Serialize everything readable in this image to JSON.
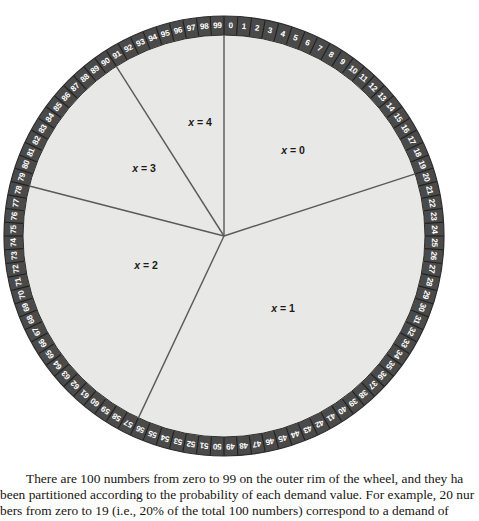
{
  "figure": {
    "name": "roulette-wheel-diagram",
    "colors": {
      "rim_fill": "#4a4a4a",
      "rim_stroke": "#2e2e2e",
      "disc_fill": "#e8e8e6",
      "divider_stroke": "#5a5a5a",
      "tick_stroke": "#20201f",
      "number_text": "#ffffff",
      "label_text": "#1a1a1a",
      "page_background": "#ffffff"
    },
    "geometry": {
      "center_x": 224,
      "center_y": 236,
      "outer_radius": 220,
      "inner_radius": 201,
      "number_radius": 210.5
    },
    "rim_numbers": [
      "0",
      "1",
      "2",
      "3",
      "4",
      "5",
      "6",
      "7",
      "8",
      "9",
      "10",
      "11",
      "12",
      "13",
      "14",
      "15",
      "16",
      "17",
      "18",
      "19",
      "20",
      "21",
      "22",
      "23",
      "24",
      "25",
      "26",
      "27",
      "28",
      "29",
      "30",
      "31",
      "32",
      "33",
      "34",
      "35",
      "36",
      "37",
      "38",
      "39",
      "40",
      "41",
      "42",
      "43",
      "44",
      "45",
      "46",
      "47",
      "48",
      "49",
      "50",
      "51",
      "52",
      "53",
      "54",
      "55",
      "56",
      "57",
      "58",
      "59",
      "60",
      "61",
      "62",
      "63",
      "64",
      "65",
      "66",
      "67",
      "68",
      "69",
      "70",
      "71",
      "72",
      "73",
      "74",
      "75",
      "76",
      "77",
      "78",
      "79",
      "80",
      "81",
      "82",
      "83",
      "84",
      "85",
      "86",
      "87",
      "88",
      "89",
      "90",
      "91",
      "92",
      "93",
      "94",
      "95",
      "96",
      "97",
      "98",
      "99"
    ],
    "sectors": [
      {
        "id": "x0",
        "label_x": "x",
        "label_eq": "= 0",
        "start_number": 0,
        "end_number": 20,
        "label_px": 293,
        "label_py": 150
      },
      {
        "id": "x1",
        "label_x": "x",
        "label_eq": "= 1",
        "start_number": 20,
        "end_number": 57,
        "label_px": 283,
        "label_py": 308
      },
      {
        "id": "x2",
        "label_x": "x",
        "label_eq": "= 2",
        "start_number": 57,
        "end_number": 79,
        "label_px": 146,
        "label_py": 265
      },
      {
        "id": "x3",
        "label_x": "x",
        "label_eq": "= 3",
        "start_number": 79,
        "end_number": 91,
        "label_px": 144,
        "label_py": 168
      },
      {
        "id": "x4",
        "label_x": "x",
        "label_eq": "= 4",
        "start_number": 91,
        "end_number": 100,
        "label_px": 200,
        "label_py": 122
      }
    ],
    "divider_numbers": [
      0,
      20,
      57,
      79,
      91
    ]
  },
  "caption": {
    "line1": "There are 100 numbers from zero to 99 on the outer rim of the wheel, and they ha",
    "line2": "been partitioned according to the probability of each demand value. For example, 20 nur",
    "line3": "bers from zero to 19 (i.e., 20% of the total 100 numbers) correspond to a demand of",
    "line4": "(0) PCs. Now we spin the wheel and let the wheel stop on a number"
  }
}
